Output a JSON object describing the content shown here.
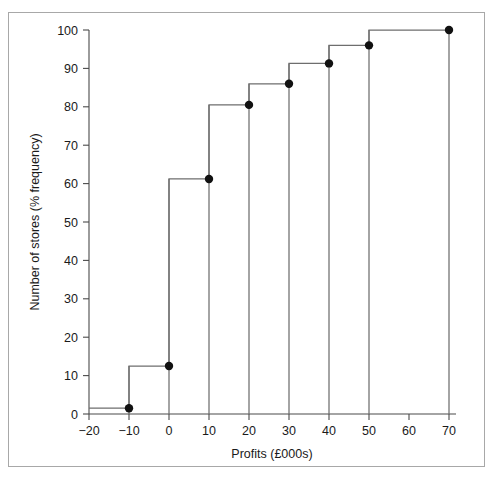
{
  "chart_data": {
    "type": "line",
    "subtype": "cumulative-frequency-step-ogive",
    "title": "",
    "xlabel": "Profits (£000s)",
    "ylabel": "Number of stores (% frequency)",
    "xlim": [
      -20,
      75
    ],
    "ylim": [
      0,
      100
    ],
    "xticks": [
      -20,
      -10,
      0,
      10,
      20,
      30,
      40,
      50,
      60,
      70
    ],
    "xtick_labels": [
      "−20",
      "−10",
      "0",
      "10",
      "20",
      "30",
      "40",
      "50",
      "60",
      "70"
    ],
    "yticks": [
      0,
      10,
      20,
      30,
      40,
      50,
      60,
      70,
      80,
      90,
      100
    ],
    "ytick_labels": [
      "0",
      "10",
      "20",
      "30",
      "40",
      "50",
      "60",
      "70",
      "80",
      "90",
      "100"
    ],
    "grid": false,
    "legend": false,
    "x": [
      -10,
      0,
      10,
      20,
      30,
      40,
      50,
      70
    ],
    "values": [
      1.5,
      12.5,
      61.2,
      80.5,
      86.0,
      91.3,
      96.0,
      100.0
    ],
    "points": [
      {
        "x": -10,
        "y": 1.5
      },
      {
        "x": 0,
        "y": 12.5
      },
      {
        "x": 10,
        "y": 61.2
      },
      {
        "x": 20,
        "y": 80.5
      },
      {
        "x": 30,
        "y": 86.0
      },
      {
        "x": 40,
        "y": 91.3
      },
      {
        "x": 50,
        "y": 96.0
      },
      {
        "x": 70,
        "y": 100.0
      }
    ],
    "step_levels": [
      {
        "from_x": -20,
        "to_x": -10,
        "y": 1.5
      },
      {
        "from_x": -10,
        "to_x": 0,
        "y": 12.5
      },
      {
        "from_x": 0,
        "to_x": 10,
        "y": 61.2
      },
      {
        "from_x": 10,
        "to_x": 20,
        "y": 80.5
      },
      {
        "from_x": 20,
        "to_x": 30,
        "y": 86.0
      },
      {
        "from_x": 30,
        "to_x": 40,
        "y": 91.3
      },
      {
        "from_x": 40,
        "to_x": 50,
        "y": 96.0
      },
      {
        "from_x": 50,
        "to_x": 70,
        "y": 100.0
      }
    ],
    "marker_style": "filled-circle",
    "colors": {
      "line": "#6e6e6e",
      "marker": "#111111",
      "axis": "#4a4a4a",
      "frame": "#a8a8a8",
      "background": "#ffffff",
      "text": "#1a1a1a"
    }
  }
}
